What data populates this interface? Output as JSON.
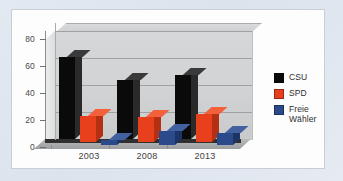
{
  "chart_data": {
    "type": "bar",
    "title": "",
    "subtitle": "",
    "xlabel": "",
    "ylabel": "",
    "categories": [
      "2003",
      "2008",
      "2013"
    ],
    "series": [
      {
        "name": "CSU",
        "color": "#0a0a0a",
        "values": [
          60.7,
          43.4,
          47.7
        ]
      },
      {
        "name": "SPD",
        "color": "#e8401c",
        "values": [
          19.6,
          18.6,
          20.6
        ]
      },
      {
        "name": "Freie Wähler",
        "color": "#2b4a8b",
        "values": [
          4.0,
          10.2,
          9.0
        ]
      }
    ],
    "ylim": [
      0,
      80
    ],
    "yticks": [
      "0",
      "20",
      "40",
      "60",
      "80"
    ],
    "grid": true,
    "legend_position": "right",
    "three_d": true
  },
  "axis": {
    "yticks": [
      "0",
      "20",
      "40",
      "60",
      "80"
    ],
    "xticks": [
      "2003",
      "2008",
      "2013"
    ]
  },
  "legend": {
    "entries": [
      {
        "label": "CSU",
        "color": "#0a0a0a"
      },
      {
        "label": "SPD",
        "color": "#e8401c"
      },
      {
        "label": "Freie Wähler",
        "color": "#2b4a8b"
      }
    ]
  },
  "colors": {
    "background": "#dee5ee",
    "panel": "#fdfdfd",
    "wall": "#d4d5d6",
    "gridline": "#9fa1a3"
  }
}
